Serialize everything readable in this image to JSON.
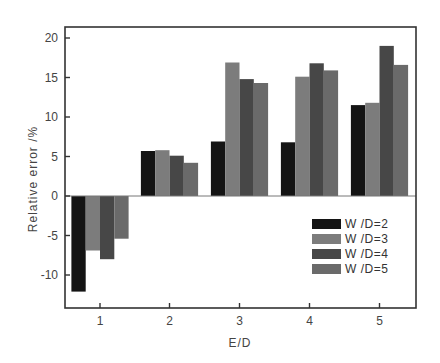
{
  "chart_data": {
    "type": "bar",
    "title": "",
    "xlabel": "E/D",
    "ylabel": "Relative error /%",
    "categories": [
      "1",
      "2",
      "3",
      "4",
      "5"
    ],
    "series": [
      {
        "name": "W/D=2",
        "color": "#141414",
        "values": [
          -12.1,
          5.7,
          6.9,
          6.8,
          11.5
        ]
      },
      {
        "name": "W/D=3",
        "color": "#7c7c7c",
        "values": [
          -6.9,
          5.8,
          16.9,
          15.1,
          11.8
        ]
      },
      {
        "name": "W/D=4",
        "color": "#474747",
        "values": [
          -8.0,
          5.1,
          14.8,
          16.8,
          19.0
        ]
      },
      {
        "name": "W/D=5",
        "color": "#6a6a6a",
        "values": [
          -5.4,
          4.2,
          14.3,
          15.9,
          16.6
        ]
      }
    ],
    "yticks": [
      -10,
      -5,
      0,
      5,
      10,
      15,
      20
    ],
    "ylim": [
      -14,
      21
    ],
    "grid": false,
    "zero_line": true,
    "legend_position": "lower right"
  }
}
